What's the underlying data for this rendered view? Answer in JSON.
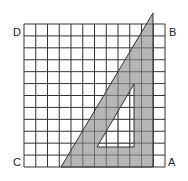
{
  "diagram": {
    "grid": {
      "rows": 12,
      "cols": 12,
      "line_color": "#333333",
      "background": "#ffffff"
    },
    "corners": {
      "A": {
        "label": "A",
        "position": "bottom-right"
      },
      "B": {
        "label": "B",
        "position": "top-right"
      },
      "C": {
        "label": "C",
        "position": "bottom-left"
      },
      "D": {
        "label": "D",
        "position": "top-left"
      }
    },
    "set_square": {
      "fill": "#a9a9a9",
      "edge_color": "#333333",
      "hole_fill": "#ffffff"
    }
  }
}
